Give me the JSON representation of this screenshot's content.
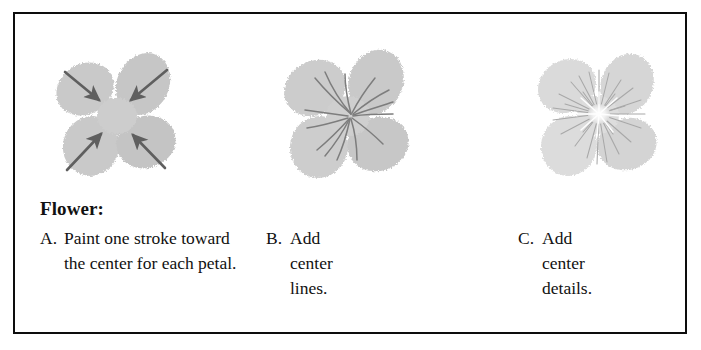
{
  "figure": {
    "title": "Flower:",
    "panels": [
      {
        "letter": "A.",
        "text": "Paint one stroke toward the center for each petal.",
        "illustration": "flower-with-inward-arrows",
        "petal_count": 4,
        "arrow_count": 4,
        "petal_color": "#c9c9c9",
        "detail_color": "#6e6e6e"
      },
      {
        "letter": "B.",
        "text": "Add\ncenter\nlines.",
        "illustration": "flower-with-center-lines",
        "petal_count": 4,
        "center_line_count": 14,
        "petal_color": "#cccccc",
        "detail_color": "#7d7d7d"
      },
      {
        "letter": "C.",
        "text": "Add\ncenter\ndetails.",
        "illustration": "flower-with-center-details",
        "petal_count": 4,
        "center_line_count": 26,
        "petal_color": "#dadada",
        "detail_color": "#a8a8a8"
      }
    ]
  },
  "colors": {
    "border": "#0d0d0d",
    "background": "#ffffff",
    "text": "#111111"
  }
}
